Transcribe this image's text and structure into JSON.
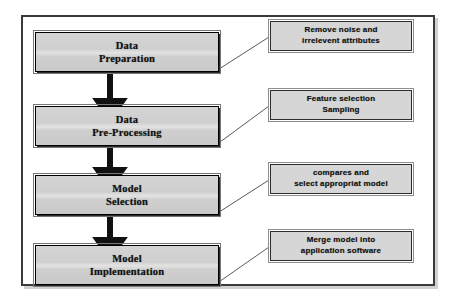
{
  "diagram": {
    "frame": {
      "border_color": "#3a3a3a",
      "background": "#ffffff"
    },
    "style": {
      "process_fill": "#cfcfcf",
      "process_border": "#000000",
      "note_fill": "#d6d6d6",
      "note_border": "#2c2c2c",
      "arrow_color": "#111111",
      "connector_color": "#4a4a4a"
    },
    "steps": [
      {
        "id": "data-preparation",
        "line1": "Data",
        "line2": "Preparation",
        "note_line1": "Remove noise and",
        "note_line2": "irrelevent attributes"
      },
      {
        "id": "data-pre-processing",
        "line1": "Data",
        "line2": "Pre-Processing",
        "note_line1": "Feature selection",
        "note_line2": "Sampling"
      },
      {
        "id": "model-selection",
        "line1": "Model",
        "line2": "Selection",
        "note_line1": "compares and",
        "note_line2": "select appropriat model"
      },
      {
        "id": "model-implementation",
        "line1": "Model",
        "line2": "Implementation",
        "note_line1": "Merge model into",
        "note_line2": "application software"
      }
    ]
  }
}
